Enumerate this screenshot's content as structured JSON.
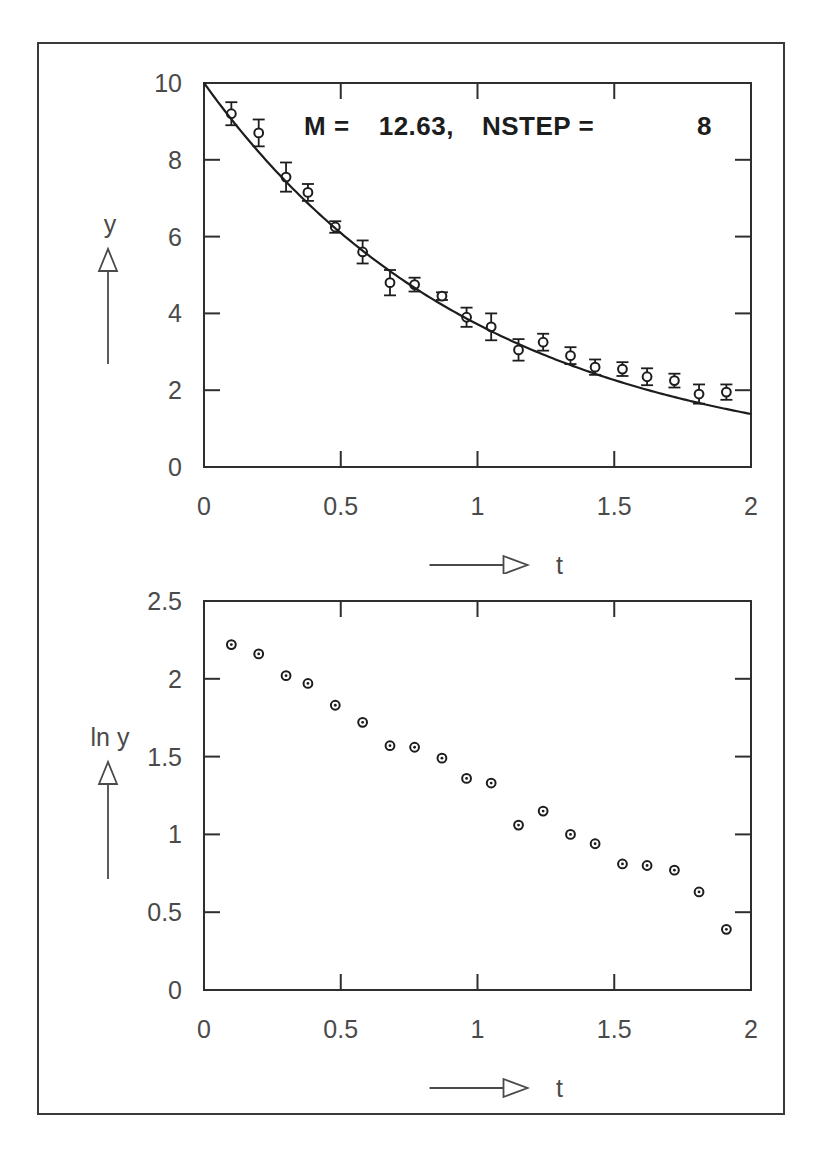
{
  "figure": {
    "border_color": "#3a3a3a",
    "background": "#ffffff",
    "ink_color": "#1d1d1d"
  },
  "chart_data": [
    {
      "id": "top-panel",
      "type": "scatter",
      "title": "M =    12.63, NSTEP =      8",
      "title_parts": {
        "m_label": "M  =",
        "m_value": "12.63,",
        "nstep_label": "NSTEP  =",
        "nstep_value": "8"
      },
      "xlabel": "t",
      "ylabel": "y",
      "xlim": [
        0,
        2
      ],
      "ylim": [
        0,
        10
      ],
      "xticks": [
        0,
        0.5,
        1,
        1.5,
        2
      ],
      "xtick_labels": [
        "0",
        "0.5",
        "1",
        "1.5",
        "2"
      ],
      "yticks": [
        0,
        2,
        4,
        6,
        8,
        10
      ],
      "ytick_labels": [
        "0",
        "2",
        "4",
        "6",
        "8",
        "10"
      ],
      "grid": false,
      "legend": "none",
      "series": [
        {
          "name": "measured decay with error bars",
          "marker": "open-circle",
          "has_errorbars": true,
          "x": [
            0.1,
            0.2,
            0.3,
            0.38,
            0.48,
            0.58,
            0.68,
            0.77,
            0.87,
            0.96,
            1.05,
            1.15,
            1.24,
            1.34,
            1.43,
            1.53,
            1.62,
            1.72,
            1.81,
            1.91
          ],
          "y": [
            9.2,
            8.7,
            7.55,
            7.15,
            6.25,
            5.6,
            4.8,
            4.75,
            4.45,
            3.9,
            3.65,
            3.05,
            3.25,
            2.9,
            2.6,
            2.55,
            2.35,
            2.25,
            1.9,
            1.95
          ],
          "yerr": [
            0.3,
            0.35,
            0.38,
            0.22,
            0.15,
            0.3,
            0.33,
            0.18,
            0.1,
            0.25,
            0.35,
            0.28,
            0.22,
            0.22,
            0.2,
            0.18,
            0.22,
            0.18,
            0.25,
            0.2
          ]
        },
        {
          "name": "exponential fit curve",
          "marker": "none",
          "has_errorbars": false,
          "fit": {
            "amplitude": 10.0,
            "decay_rate": 0.99,
            "x_start": 0.0,
            "x_end": 2.0
          }
        }
      ]
    },
    {
      "id": "bottom-panel",
      "type": "scatter",
      "title": "",
      "xlabel": "t",
      "ylabel": "ln  y",
      "xlim": [
        0,
        2
      ],
      "ylim": [
        0,
        2.5
      ],
      "xticks": [
        0,
        0.5,
        1,
        1.5,
        2
      ],
      "xtick_labels": [
        "0",
        "0.5",
        "1",
        "1.5",
        "2"
      ],
      "yticks": [
        0,
        0.5,
        1,
        1.5,
        2,
        2.5
      ],
      "ytick_labels": [
        "0",
        "0.5",
        "1",
        "1.5",
        "2",
        "2.5"
      ],
      "grid": false,
      "legend": "none",
      "series": [
        {
          "name": "log of measured decay",
          "marker": "open-circle-dot",
          "has_errorbars": false,
          "x": [
            0.1,
            0.2,
            0.3,
            0.38,
            0.48,
            0.58,
            0.68,
            0.77,
            0.87,
            0.96,
            1.05,
            1.15,
            1.24,
            1.34,
            1.43,
            1.53,
            1.62,
            1.72,
            1.81,
            1.91
          ],
          "y": [
            2.22,
            2.16,
            2.02,
            1.97,
            1.83,
            1.72,
            1.57,
            1.56,
            1.49,
            1.36,
            1.33,
            1.06,
            1.15,
            1.0,
            0.94,
            0.81,
            0.8,
            0.77,
            0.63,
            0.39,
            0.46
          ]
        }
      ]
    }
  ]
}
